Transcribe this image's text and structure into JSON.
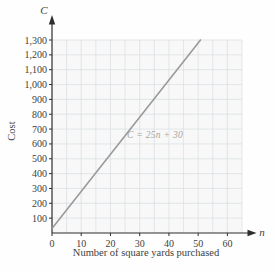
{
  "figure": {
    "y_axis_variable": "C",
    "x_axis_variable": "n",
    "y_axis_title": "Cost",
    "x_axis_title": "Number of square yards purchased",
    "equation_label": "C = 25n + 30"
  },
  "chart_data": {
    "type": "line",
    "title": "",
    "xlabel": "Number of square yards purchased",
    "ylabel": "Cost",
    "x_variable": "n",
    "y_variable": "C",
    "equation": "C = 25n + 30",
    "xlim": [
      0,
      65
    ],
    "ylim": [
      0,
      1300
    ],
    "x_ticks": [
      {
        "value": 0,
        "label": "0"
      },
      {
        "value": 10,
        "label": "10"
      },
      {
        "value": 20,
        "label": "20"
      },
      {
        "value": 30,
        "label": "30"
      },
      {
        "value": 40,
        "label": "40"
      },
      {
        "value": 50,
        "label": "50"
      },
      {
        "value": 60,
        "label": "60"
      }
    ],
    "y_ticks": [
      {
        "value": 100,
        "label": "100"
      },
      {
        "value": 200,
        "label": "200"
      },
      {
        "value": 300,
        "label": "300"
      },
      {
        "value": 400,
        "label": "400"
      },
      {
        "value": 500,
        "label": "500"
      },
      {
        "value": 600,
        "label": "600"
      },
      {
        "value": 700,
        "label": "700"
      },
      {
        "value": 800,
        "label": "800"
      },
      {
        "value": 900,
        "label": "900"
      },
      {
        "value": 1000,
        "label": "1,000"
      },
      {
        "value": 1100,
        "label": "1,100"
      },
      {
        "value": 1200,
        "label": "1,200"
      },
      {
        "value": 1300,
        "label": "1,300"
      }
    ],
    "grid": {
      "visible": true,
      "x_step": 5,
      "y_step": 100
    },
    "series": [
      {
        "name": "C = 25n + 30",
        "slope": 25,
        "intercept": 30,
        "points": [
          [
            0,
            30
          ],
          [
            50.8,
            1300
          ]
        ]
      }
    ],
    "legend": "none",
    "colors": {
      "line": "#9a9a9a",
      "grid": "#d9dde2",
      "axis": "#2e2d2b",
      "tick_text": "#403f3d",
      "equation_text": "#a6a5a2",
      "plot_background": "#f7f8f7"
    }
  }
}
